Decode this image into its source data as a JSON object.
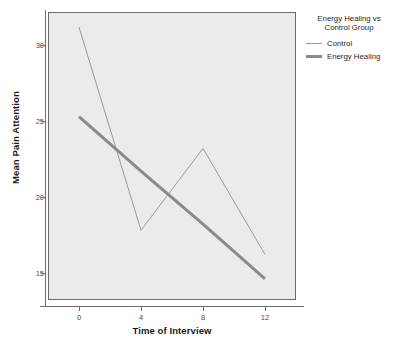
{
  "chart_data": {
    "type": "line",
    "title": "",
    "xlabel": "Time of Interview",
    "ylabel": "Mean Pain Attention",
    "x": [
      0,
      4,
      8,
      12
    ],
    "xticks": [
      "0",
      "4",
      "8",
      "12"
    ],
    "yticks": [
      "15",
      "20",
      "25",
      "30"
    ],
    "ytick_values": [
      15,
      20,
      25,
      30
    ],
    "xlim": [
      -2,
      14
    ],
    "ylim": [
      13.2,
      32.2
    ],
    "grid": false,
    "legend_position": "top-right-outside",
    "legend_title": "Energy Healing vs Control Group",
    "series": [
      {
        "name": "Control",
        "values": [
          31.2,
          17.8,
          23.2,
          16.2
        ],
        "style": "thin",
        "color": "#9a9a9a"
      },
      {
        "name": "Energy Healing",
        "values": [
          25.3,
          21.7,
          18.2,
          14.6
        ],
        "style": "thick",
        "color": "#8a8a8a"
      }
    ]
  },
  "legend": {
    "title_line1": "Energy Healing vs",
    "title_line2": "Control Group",
    "entries": [
      {
        "label": "Control"
      },
      {
        "label": "Energy Healing"
      }
    ]
  },
  "axes": {
    "x_title": "Time of Interview",
    "y_title": "Mean Pain Attention",
    "x_tick_labels": [
      "0",
      "4",
      "8",
      "12"
    ],
    "y_tick_labels": [
      "15",
      "20",
      "25",
      "30"
    ]
  },
  "colors": {
    "plot_background": "#ebebeb",
    "frame": "#6d6d6d",
    "control_line": "#9a9a9a",
    "energy_healing_line": "#8a8a8a",
    "text": "#1f1f1f"
  }
}
